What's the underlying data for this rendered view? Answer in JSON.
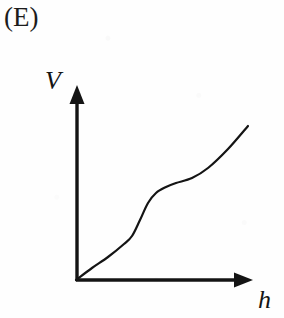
{
  "figure": {
    "option_label": "(E)",
    "background_color": "#fefefe",
    "ink_color": "#141414"
  },
  "axes": {
    "y_axis_label": "V",
    "x_axis_label": "h",
    "y_axis_name": "Volume",
    "x_axis_name": "height",
    "origin": {
      "x": 76,
      "y": 280
    },
    "y_axis_tip": {
      "x": 76,
      "y": 86
    },
    "x_axis_tip": {
      "x": 252,
      "y": 280
    },
    "arrowheads": "both",
    "ticks": "none",
    "gridlines": "none"
  },
  "chart_data": {
    "type": "line",
    "title": "(E)",
    "xlabel": "h",
    "ylabel": "V",
    "grid": false,
    "legend": "none",
    "axis_ticks": "none",
    "xlim": [
      0,
      1
    ],
    "ylim": [
      0,
      1
    ],
    "x": [
      0.0,
      0.1,
      0.2,
      0.3,
      0.35,
      0.4,
      0.45,
      0.5,
      0.55,
      0.6,
      0.7,
      0.8,
      0.9,
      1.0
    ],
    "y": [
      0.0,
      0.1,
      0.2,
      0.31,
      0.37,
      0.46,
      0.55,
      0.6,
      0.63,
      0.65,
      0.69,
      0.76,
      0.85,
      0.95
    ],
    "curve_points_px": [
      [
        76,
        280
      ],
      [
        92,
        268
      ],
      [
        108,
        257
      ],
      [
        124,
        244
      ],
      [
        132,
        236
      ],
      [
        140,
        220
      ],
      [
        148,
        203
      ],
      [
        156,
        193
      ],
      [
        166,
        187
      ],
      [
        176,
        183
      ],
      [
        192,
        178
      ],
      [
        208,
        168
      ],
      [
        228,
        149
      ],
      [
        248,
        126
      ]
    ],
    "series": [
      {
        "name": "V vs h",
        "color": "#141414",
        "line_width_px": 2.2,
        "style": "solid"
      }
    ]
  }
}
